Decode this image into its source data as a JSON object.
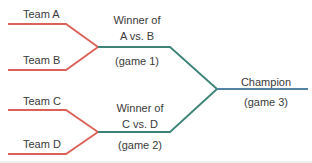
{
  "diagram": {
    "title_hint": "single-elimination tournament bracket",
    "teams": {
      "a": "Team A",
      "b": "Team B",
      "c": "Team C",
      "d": "Team D"
    },
    "semifinals": {
      "game1": {
        "winner_line1": "Winner of",
        "winner_line2": "A vs. B",
        "game_label": "(game 1)"
      },
      "game2": {
        "winner_line1": "Winner of",
        "winner_line2": "C vs. D",
        "game_label": "(game 2)"
      }
    },
    "final": {
      "label": "Champion",
      "game_label": "(game 3)"
    },
    "colors": {
      "team_line": "#db6158",
      "semifinal_line": "#3e8377",
      "final_line": "#5083a6",
      "text": "#3a3a3a"
    }
  }
}
